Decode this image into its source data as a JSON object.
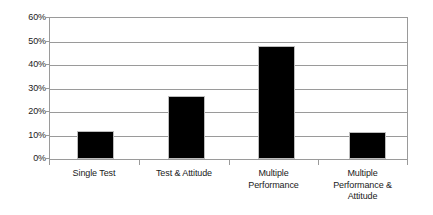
{
  "chart_data": {
    "type": "bar",
    "title": "",
    "subtitle": "",
    "xlabel": "",
    "ylabel": "",
    "categories": [
      "Single Test",
      "Test & Attitude",
      "Multiple Performance",
      "Multiple Performance & Attitude"
    ],
    "category_lines": [
      [
        "Single Test"
      ],
      [
        "Test & Attitude"
      ],
      [
        "Multiple",
        "Performance"
      ],
      [
        "Multiple",
        "Performance &",
        "Attitude"
      ]
    ],
    "values": [
      12,
      27,
      48,
      11.5
    ],
    "value_labels": [
      "12%",
      "27%",
      "48%",
      "11.5%"
    ],
    "ylim": [
      0,
      60
    ],
    "ytick_values": [
      60,
      50,
      40,
      30,
      20,
      10,
      0
    ],
    "ytick_labels": [
      "60%",
      "50%",
      "40%",
      "30%",
      "20%",
      "10%",
      "0%"
    ],
    "grid": true,
    "grid_axis": "y",
    "legend": false,
    "legend_position": "none",
    "bar_color": "#000000",
    "bar_edge_color": "#bdbdbd",
    "axis_color": "#9a9a9a",
    "background_color": "#ffffff",
    "text_color": "#1a1a1a"
  }
}
